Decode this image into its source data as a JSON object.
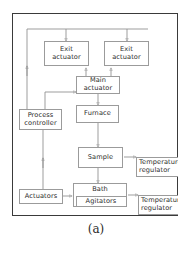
{
  "figure": {
    "caption": "(a)",
    "frame_color": "#3a3a3a",
    "box_border_color": "#9b9b9b",
    "line_color": "#8c8c8c",
    "text_color": "#2b2b2b",
    "background": "#ffffff"
  },
  "nodes": {
    "exit_actuator_left": {
      "line1": "Exit",
      "line2": "actuator"
    },
    "exit_actuator_right": {
      "line1": "Exit",
      "line2": "actuator"
    },
    "main_actuator": {
      "line1": "Main",
      "line2": "actuator"
    },
    "process_controller": {
      "line1": "Process",
      "line2": "controller"
    },
    "furnace": {
      "line1": "Furnace",
      "line2": ""
    },
    "sample": {
      "line1": "Sample",
      "line2": ""
    },
    "temp_regulator_top": {
      "line1": "Temperature",
      "line2": "regulator"
    },
    "temp_regulator_bottom": {
      "line1": "Temperature",
      "line2": "regulator"
    },
    "bath": {
      "line1": "Bath",
      "line2": ""
    },
    "agitators": {
      "line1": "Agitators",
      "line2": ""
    },
    "actuators": {
      "line1": "Actuators",
      "line2": ""
    }
  },
  "connections": [
    {
      "name": "bus-to-exit-actuator-left",
      "from": "top-bus",
      "to": "exit_actuator_left",
      "direction": "down"
    },
    {
      "name": "bus-to-exit-actuator-right",
      "from": "top-bus",
      "to": "exit_actuator_right",
      "direction": "down"
    },
    {
      "name": "process-controller-to-bus",
      "from": "process_controller",
      "to": "top-bus",
      "direction": "up"
    },
    {
      "name": "main-to-exit-actuator-left",
      "from": "main_actuator",
      "to": "exit_actuator_left",
      "direction": "up"
    },
    {
      "name": "main-to-exit-actuator-right",
      "from": "main_actuator",
      "to": "exit_actuator_right",
      "direction": "up"
    },
    {
      "name": "process-controller-to-main",
      "from": "process_controller",
      "to": "main_actuator",
      "direction": "right"
    },
    {
      "name": "main-actuator-to-furnace",
      "from": "main_actuator",
      "to": "furnace",
      "direction": "down"
    },
    {
      "name": "furnace-to-sample",
      "from": "furnace",
      "to": "sample",
      "direction": "down"
    },
    {
      "name": "sample-to-temp-regulator",
      "from": "sample",
      "to": "temp_regulator_top",
      "direction": "right"
    },
    {
      "name": "sample-to-bath",
      "from": "sample",
      "to": "bath",
      "direction": "down"
    },
    {
      "name": "bath-to-temp-regulator",
      "from": "bath",
      "to": "temp_regulator_bottom",
      "direction": "right"
    },
    {
      "name": "actuators-to-agitators",
      "from": "actuators",
      "to": "agitators",
      "direction": "right"
    },
    {
      "name": "actuators-to-process-controller",
      "from": "actuators",
      "to": "process_controller",
      "direction": "up"
    }
  ]
}
